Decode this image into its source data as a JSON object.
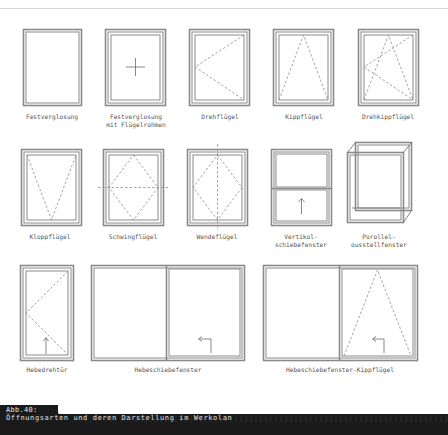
{
  "figure": {
    "number_label": "Abb.40:",
    "caption": "Öffnungsarten und deren Darstellung im Werkplan",
    "caption_rendered": "Öffnungsarten und deren Darstellung im Werkolan",
    "colors": {
      "frame": "#8a8a8a",
      "line": "#666666",
      "dash": "#8c8c8c",
      "label": "#555555",
      "caption_bg": "#1a1a1a",
      "caption_text": "#e0e0e0"
    }
  },
  "rows": [
    {
      "items": [
        {
          "id": "festverglasung",
          "label_lines": [
            "Festverglasung"
          ],
          "symbol": "fixed-frame"
        },
        {
          "id": "festverglasung-fluegelrahmen",
          "label_lines": [
            "Festverglasung",
            "mit Flügelrahmen"
          ],
          "symbol": "fixed-with-sash-cross"
        },
        {
          "id": "drehfluegel",
          "label_lines": [
            "Drehflügel"
          ],
          "symbol": "side-hung-triangle-left"
        },
        {
          "id": "kippfluegel",
          "label_lines": [
            "Kippflügel"
          ],
          "symbol": "bottom-hung-triangle-top"
        },
        {
          "id": "drehkippfluegel",
          "label_lines": [
            "Drehkippflügel"
          ],
          "symbol": "tilt-turn-double-triangle"
        }
      ]
    },
    {
      "items": [
        {
          "id": "klappfluegel",
          "label_lines": [
            "Klappflügel"
          ],
          "symbol": "top-hung-triangle-bottom"
        },
        {
          "id": "schwingfluegel",
          "label_lines": [
            "Schwingflügel"
          ],
          "symbol": "horizontal-pivot-diamond"
        },
        {
          "id": "wendefluegel",
          "label_lines": [
            "Wendeflügel"
          ],
          "symbol": "vertical-pivot-diamond"
        },
        {
          "id": "vertikalschiebefenster",
          "label_lines": [
            "Vertikal-",
            "schiebefenster"
          ],
          "symbol": "vertical-slide-arrow-up"
        },
        {
          "id": "parallelausstellfenster",
          "label_lines": [
            "Parallel-",
            "ausstellfenster"
          ],
          "symbol": "parallel-projecting-box"
        }
      ]
    },
    {
      "items": [
        {
          "id": "hebedrehtuer",
          "label_lines": [
            "Hebedrehtür"
          ],
          "symbol": "lift-turn-door"
        },
        {
          "id": "hebeschiebefenster",
          "label_lines": [
            "Hebeschiebefenster"
          ],
          "symbol": "lift-slide-arrow-left"
        },
        {
          "id": "hebeschiebefenster-kippfluegel",
          "label_lines": [
            "Hebeschiebefenster-Kippflügel"
          ],
          "symbol": "lift-slide-tilt"
        }
      ]
    }
  ],
  "labels_rendered": {
    "r1": [
      "Festverglosung",
      "Festverglosung",
      "mit Flügelrohmen",
      "Drehflügel",
      "Kippflügel",
      "Drehkippflügel"
    ],
    "r2": [
      "Kloppflügel",
      "Schwingflügel",
      "Wendeflügel",
      "Vertikol-",
      "schiebefenster",
      "Porollel-",
      "ousstellfenster"
    ],
    "r3": [
      "Hebedrehtür",
      "Hebeschiebefenster",
      "Hebeschiebefenster-Kippflügel"
    ]
  }
}
